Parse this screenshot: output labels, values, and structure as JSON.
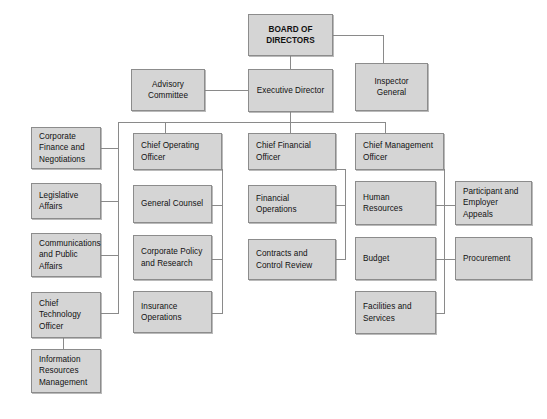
{
  "diagram": {
    "type": "organization-chart",
    "colors": {
      "background": "#ffffff",
      "node_fill": "#d5d5d5",
      "node_border": "#8c8c8c",
      "connector": "#8a8a8a",
      "text": "#111111"
    },
    "nodes": {
      "board_of_directors": "BOARD OF DIRECTORS",
      "advisory_committee": "Advisory Committee",
      "executive_director": "Executive Director",
      "inspector_general": "Inspector General",
      "corporate_finance": "Corporate Finance and Negotiations",
      "chief_operating_officer": "Chief Operating Officer",
      "chief_financial_officer": "Chief Financial Officer",
      "chief_management_officer": "Chief Management Officer",
      "legislative_affairs": "Legislative Affairs",
      "general_counsel": "General Counsel",
      "financial_operations": "Financial Operations",
      "human_resources": "Human Resources",
      "participant_appeals": "Participant and Employer Appeals",
      "communications": "Communications and Public Affairs",
      "corporate_policy": "Corporate Policy and Research",
      "contracts_control": "Contracts and Control Review",
      "budget": "Budget",
      "procurement": "Procurement",
      "chief_technology_officer": "Chief Technology Officer",
      "insurance_operations": "Insurance Operations",
      "facilities_services": "Facilities and Services",
      "information_resources": "Information Resources Management"
    }
  }
}
